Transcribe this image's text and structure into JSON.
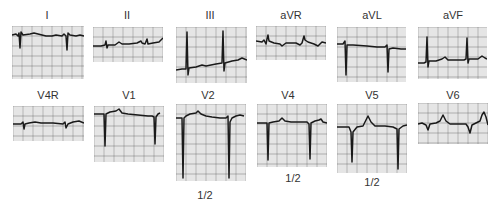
{
  "figure": {
    "rows": [
      {
        "leads": [
          {
            "label": "I",
            "box": [
              12,
              26,
              72,
              53
            ],
            "label_pos": [
              47,
              10
            ],
            "trace": "M0,9 L4,8 L6,10 L7,7 L8,22 L9,6 L11,9 L18,8 L22,7 L26,8 L34,10 L40,10 L44,9 L50,10 L52,8 L54,10 L55,24 L56,7 L58,9 L64,10 L68,9 L72,10",
            "scale": null
          },
          {
            "label": "II",
            "box": [
              93,
              27,
              70,
              35
            ],
            "label_pos": [
              127,
              10
            ],
            "trace": "M0,19 L8,19 L12,18 L13,14 L14,21 L15,18 L22,18 L26,15 L29,17 L36,17 L44,16 L48,14 L49,16 L52,17 L54,12 L55,17 L60,16 L66,15 L70,11",
            "scale": null
          },
          {
            "label": "III",
            "box": [
              176,
              27,
              71,
              56
            ],
            "label_pos": [
              210,
              10
            ],
            "trace": "M0,43 L6,42 L10,42 L11,5 L12,48 L13,41 L20,40 L26,38 L30,39 L40,37 L46,36 L47,4 L48,44 L49,36 L56,34 L62,33 L66,31 L71,33",
            "scale": null
          },
          {
            "label": "aVR",
            "box": [
              256,
              26,
              70,
              34
            ],
            "label_pos": [
              291,
              10
            ],
            "trace": "M0,15 L6,16 L8,14 L10,18 L11,13 L12,9 L13,15 L18,17 L24,18 L26,20 L30,17 L40,17 L44,19 L46,17 L48,10 L49,14 L52,16 L58,18 L62,20 L66,16 L70,17",
            "scale": null
          },
          {
            "label": "aVL",
            "box": [
              337,
              27,
              69,
              55
            ],
            "label_pos": [
              372,
              10
            ],
            "trace": "M0,17 L6,17 L8,14 L9,48 L10,18 L16,18 L30,19 L40,20 L48,20 L50,18 L51,45 L52,22 L56,21 L64,22 L69,22",
            "scale": null
          },
          {
            "label": "aVF",
            "box": [
              418,
              27,
              69,
              52
            ],
            "label_pos": [
              453,
              10
            ],
            "trace": "M0,36 L6,36 L8,35 L9,10 L10,40 L11,34 L18,34 L24,32 L27,30 L30,33 L38,33 L46,33 L48,32 L49,11 L50,36 L51,32 L60,32 L64,29 L67,31 L69,32",
            "scale": null
          }
        ]
      },
      {
        "leads": [
          {
            "label": "V4R",
            "box": [
              13,
              106,
              71,
              35
            ],
            "label_pos": [
              48,
              90
            ],
            "trace": "M0,18 L8,18 L10,16 L11,23 L12,18 L16,17 L22,16 L28,17 L40,17 L50,18 L52,16 L53,22 L55,18 L60,16 L66,15 L71,17",
            "scale": null
          },
          {
            "label": "V1",
            "box": [
              94,
              106,
              70,
              56
            ],
            "label_pos": [
              129,
              90
            ],
            "trace": "M0,8 L6,8 L10,8 L11,40 L12,8 L16,6 L22,5 L25,3 L28,7 L34,8 L44,9 L54,10 L58,10 L60,11 L61,38 L62,11 L64,8 L66,7",
            "scale": null
          },
          {
            "label": "V2",
            "box": [
              176,
              104,
              70,
              77
            ],
            "label_pos": [
              208,
              90
            ],
            "trace": "M0,14 L4,14 L6,14 L7,74 L8,14 L10,12 L14,10 L20,9 L22,7 L25,10 L30,12 L36,13 L44,14 L50,14 L52,12 L53,74 L54,18 L56,14 L60,12 L64,11 L68,12",
            "scale": "1/2",
            "scale_pos": [
              205,
              190
            ]
          },
          {
            "label": "V4",
            "box": [
              257,
              104,
              70,
              63
            ],
            "label_pos": [
              288,
              90
            ],
            "trace": "M0,19 L6,19 L10,19 L11,56 L12,19 L16,18 L22,17 L25,14 L28,17 L34,18 L44,18 L50,18 L52,20 L53,55 L54,19 L58,17 L62,16 L64,15 L66,18 L70,19",
            "scale": "1/2",
            "scale_pos": [
              293,
              173
            ]
          },
          {
            "label": "V5",
            "box": [
              337,
              104,
              70,
              69
            ],
            "label_pos": [
              372,
              90
            ],
            "trace": "M0,23 L8,23 L12,23 L14,28 L15,58 L16,28 L20,23 L26,22 L28,18 L31,12 L34,18 L38,22 L48,22 L56,23 L60,25 L61,65 L62,25 L66,22 L70,21",
            "scale": "1/2",
            "scale_pos": [
              372,
              177
            ]
          },
          {
            "label": "V6",
            "box": [
              418,
              103,
              70,
              41
            ],
            "label_pos": [
              453,
              90
            ],
            "trace": "M0,21 L4,20 L8,22 L10,27 L12,21 L18,20 L22,18 L25,12 L28,18 L32,21 L44,21 L48,21 L50,24 L52,30 L54,22 L58,20 L62,18 L64,12 L66,9 L68,14 L70,22",
            "scale": null
          }
        ]
      }
    ],
    "colors": {
      "grid_minor": "#c8c8c8",
      "grid_major": "#7a7a7a",
      "trace": "#1a1a1a",
      "paper": "#f4f4f4",
      "label": "#333333"
    }
  }
}
